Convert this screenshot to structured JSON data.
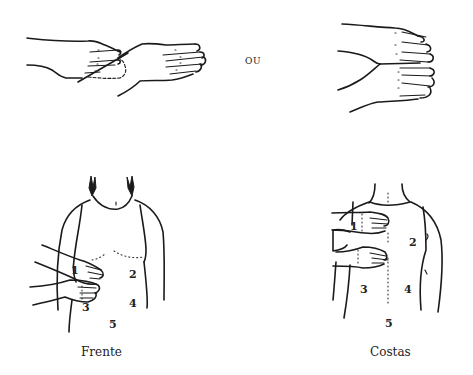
{
  "figure": {
    "connector_label": "OU",
    "panels": {
      "hands_left": {
        "description": "Hands overlapped at wrist (one on top of the other)"
      },
      "hands_right": {
        "description": "Hands stacked side by side, palms together"
      },
      "front": {
        "caption": "Frente",
        "positions": [
          "1",
          "2",
          "3",
          "4",
          "5"
        ]
      },
      "back": {
        "caption": "Costas",
        "positions": [
          "1",
          "2",
          "3",
          "4",
          "5"
        ]
      }
    }
  }
}
